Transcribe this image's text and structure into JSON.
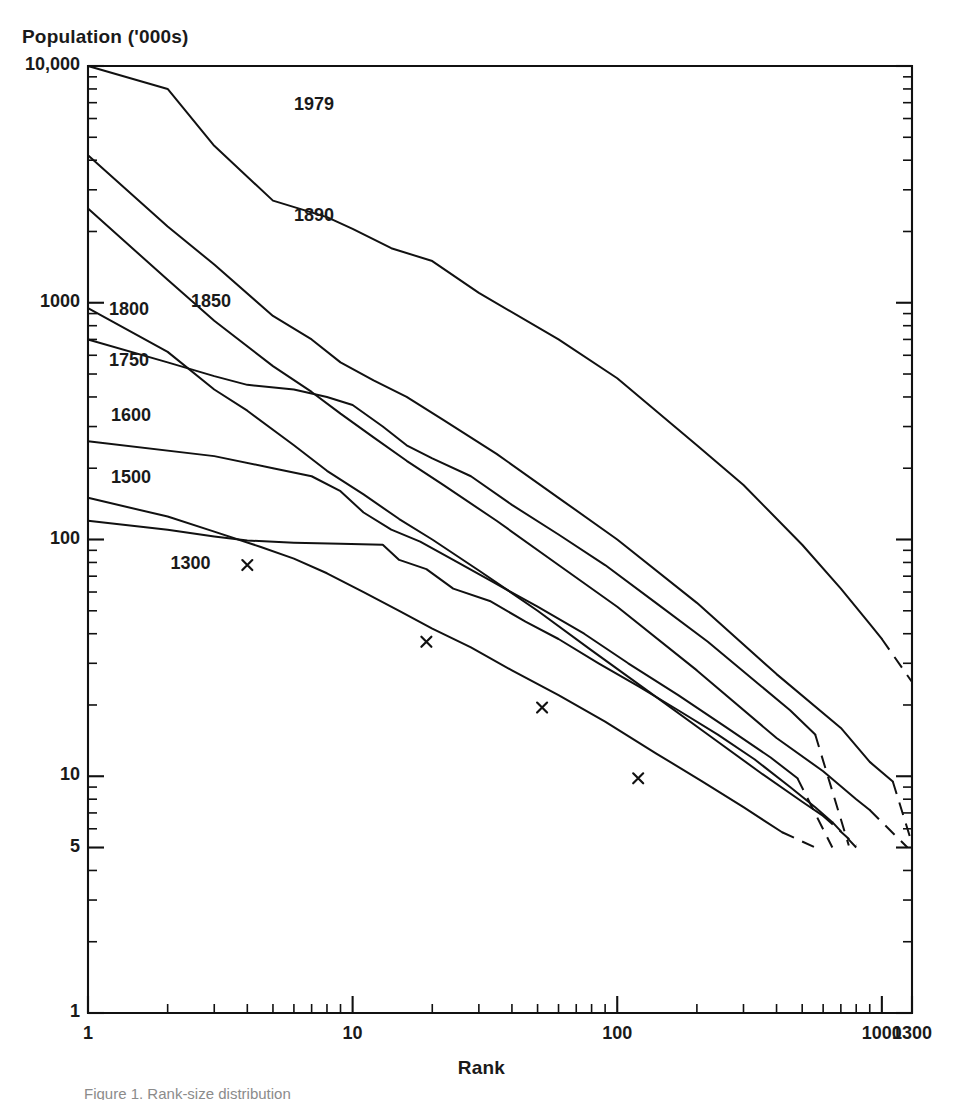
{
  "figure": {
    "caption": "Figure 1.   Rank-size distribution"
  },
  "chart_data": {
    "type": "line",
    "title": "",
    "xlabel": "Rank",
    "ylabel": "Population ('000s)",
    "xscale": "log",
    "yscale": "log",
    "xlim": [
      1,
      1300
    ],
    "ylim": [
      1,
      10000
    ],
    "grid": false,
    "legend": "inline-labels",
    "xticks": [
      1,
      10,
      100,
      1000,
      1300
    ],
    "xtick_labels": [
      "1",
      "10",
      "100",
      "1000",
      "1300"
    ],
    "yticks": [
      1,
      5,
      10,
      100,
      1000,
      10000
    ],
    "ytick_labels": [
      "1",
      "5",
      "10",
      "100",
      "1000",
      "10,000"
    ],
    "marker_symbol": "x",
    "series": [
      {
        "name": "1979",
        "label": "1979",
        "label_x": 6.0,
        "label_y": 6800,
        "solid": [
          [
            1,
            10000
          ],
          [
            2,
            8000
          ],
          [
            3,
            4600
          ],
          [
            5,
            2700
          ],
          [
            8,
            2300
          ],
          [
            10,
            2050
          ],
          [
            14,
            1700
          ],
          [
            20,
            1500
          ],
          [
            30,
            1100
          ],
          [
            60,
            700
          ],
          [
            100,
            480
          ],
          [
            200,
            250
          ],
          [
            300,
            170
          ],
          [
            500,
            95
          ],
          [
            700,
            62
          ],
          [
            900,
            44
          ],
          [
            1000,
            38
          ]
        ],
        "dashed": [
          [
            1000,
            38
          ],
          [
            1300,
            25
          ]
        ]
      },
      {
        "name": "1890",
        "label": "1890",
        "label_x": 6.0,
        "label_y": 2300,
        "solid": [
          [
            1,
            4200
          ],
          [
            2,
            2100
          ],
          [
            3,
            1450
          ],
          [
            5,
            880
          ],
          [
            7,
            700
          ],
          [
            9,
            560
          ],
          [
            12,
            470
          ],
          [
            16,
            400
          ],
          [
            22,
            320
          ],
          [
            35,
            230
          ],
          [
            60,
            150
          ],
          [
            100,
            100
          ],
          [
            200,
            54
          ],
          [
            400,
            27
          ],
          [
            700,
            16
          ],
          [
            900,
            11.5
          ],
          [
            1100,
            9.5
          ]
        ],
        "dashed": [
          [
            1100,
            9.5
          ],
          [
            1300,
            5.2
          ]
        ]
      },
      {
        "name": "1850",
        "label": "1850",
        "label_x": 2.45,
        "label_y": 1000,
        "solid": [
          [
            1,
            2500
          ],
          [
            2,
            1250
          ],
          [
            3,
            840
          ],
          [
            5,
            540
          ],
          [
            7,
            420
          ],
          [
            9,
            340
          ],
          [
            12,
            270
          ],
          [
            16,
            215
          ],
          [
            22,
            170
          ],
          [
            35,
            120
          ],
          [
            60,
            78
          ],
          [
            100,
            52
          ],
          [
            200,
            28
          ],
          [
            400,
            14.5
          ],
          [
            600,
            10.5
          ],
          [
            800,
            8.0
          ],
          [
            900,
            7.2
          ]
        ],
        "dashed": [
          [
            900,
            7.2
          ],
          [
            1250,
            5.0
          ]
        ]
      },
      {
        "name": "1800",
        "label": "1800",
        "label_x": 1.2,
        "label_y": 920,
        "solid": [
          [
            1,
            950
          ],
          [
            2,
            620
          ],
          [
            3,
            430
          ],
          [
            4,
            350
          ],
          [
            6,
            250
          ],
          [
            8,
            195
          ],
          [
            11,
            155
          ],
          [
            15,
            122
          ],
          [
            20,
            100
          ],
          [
            30,
            74
          ],
          [
            50,
            50
          ],
          [
            80,
            34
          ],
          [
            130,
            23
          ],
          [
            220,
            15
          ],
          [
            350,
            10.3
          ],
          [
            500,
            7.8
          ],
          [
            600,
            6.8
          ]
        ],
        "dashed": [
          [
            600,
            6.8
          ],
          [
            800,
            5.1
          ]
        ]
      },
      {
        "name": "1750",
        "label": "1750",
        "label_x": 1.2,
        "label_y": 560,
        "solid": [
          [
            1,
            700
          ],
          [
            2,
            560
          ],
          [
            3,
            490
          ],
          [
            4,
            450
          ],
          [
            6,
            430
          ],
          [
            8,
            400
          ],
          [
            10,
            370
          ],
          [
            13,
            300
          ],
          [
            16,
            250
          ],
          [
            20,
            220
          ],
          [
            28,
            185
          ],
          [
            40,
            140
          ],
          [
            60,
            105
          ],
          [
            90,
            78
          ],
          [
            140,
            54
          ],
          [
            220,
            37
          ],
          [
            350,
            24
          ],
          [
            450,
            19
          ],
          [
            560,
            15
          ]
        ],
        "dashed": [
          [
            560,
            15
          ],
          [
            750,
            5.1
          ]
        ]
      },
      {
        "name": "1600",
        "label": "1600",
        "label_x": 1.22,
        "label_y": 330,
        "solid": [
          [
            1,
            260
          ],
          [
            3,
            225
          ],
          [
            5,
            200
          ],
          [
            7,
            185
          ],
          [
            9,
            160
          ],
          [
            11,
            130
          ],
          [
            14,
            110
          ],
          [
            18,
            98
          ],
          [
            24,
            82
          ],
          [
            34,
            66
          ],
          [
            50,
            52
          ],
          [
            75,
            40
          ],
          [
            110,
            30
          ],
          [
            170,
            22
          ],
          [
            260,
            16
          ],
          [
            380,
            12
          ],
          [
            480,
            9.8
          ]
        ],
        "dashed": [
          [
            480,
            9.8
          ],
          [
            650,
            5.0
          ]
        ]
      },
      {
        "name": "1500",
        "label": "1500",
        "label_x": 1.22,
        "label_y": 180,
        "solid": [
          [
            1,
            150
          ],
          [
            2,
            125
          ],
          [
            3,
            108
          ],
          [
            4.5,
            93
          ],
          [
            6,
            83
          ],
          [
            8,
            72
          ],
          [
            11,
            60
          ],
          [
            15,
            50
          ],
          [
            20,
            42
          ],
          [
            28,
            35
          ],
          [
            40,
            28
          ],
          [
            60,
            22
          ],
          [
            90,
            17
          ],
          [
            140,
            12.5
          ],
          [
            210,
            9.5
          ],
          [
            300,
            7.4
          ],
          [
            420,
            5.8
          ]
        ],
        "dashed": [
          [
            420,
            5.8
          ],
          [
            560,
            5.0
          ]
        ]
      },
      {
        "name": "1300",
        "label": "1300",
        "label_x": 2.05,
        "label_y": 78,
        "markers": [
          [
            4,
            78
          ],
          [
            19,
            37
          ],
          [
            52,
            19.5
          ],
          [
            120,
            9.8
          ]
        ],
        "solid": [
          [
            1,
            120
          ],
          [
            2,
            110
          ],
          [
            3,
            103
          ],
          [
            4,
            99
          ],
          [
            6,
            97
          ],
          [
            9,
            96
          ],
          [
            13,
            95
          ],
          [
            15,
            82
          ],
          [
            19,
            75
          ],
          [
            24,
            62
          ],
          [
            33,
            55
          ],
          [
            45,
            45
          ],
          [
            60,
            38
          ],
          [
            85,
            30
          ],
          [
            120,
            24
          ],
          [
            170,
            19
          ],
          [
            240,
            15
          ],
          [
            330,
            11.8
          ],
          [
            450,
            9.0
          ],
          [
            560,
            7.4
          ],
          [
            650,
            6.4
          ]
        ],
        "dashed": [
          [
            650,
            6.4
          ],
          [
            800,
            5.0
          ]
        ]
      }
    ]
  }
}
